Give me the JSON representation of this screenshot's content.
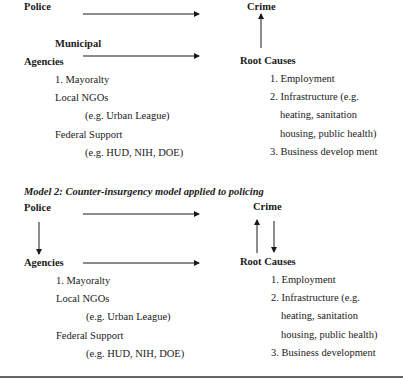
{
  "model1": {
    "police": "Police",
    "crime": "Crime",
    "municipal": "Municipal",
    "agencies": "Agencies",
    "root_causes": "Root Causes",
    "agency_items": [
      "1. Mayoralty",
      "Local NGOs",
      "(e.g. Urban League)",
      "Federal Support",
      "(e.g. HUD, NIH, DOE)"
    ],
    "root_items": [
      "1. Employment",
      "2. Infrastructure (e.g.",
      "heating, sanitation",
      "housing, public health)",
      "3. Business develop ment"
    ]
  },
  "model2": {
    "title": "Model 2: Counter-insurgency model applied to policing",
    "police": "Police",
    "crime": "Crime",
    "agencies": "Agencies",
    "root_causes": "Root Causes",
    "agency_items": [
      "1. Mayoralty",
      "Local NGOs",
      "(e.g. Urban League)",
      "Federal Support",
      "(e.g. HUD, NIH, DOE)"
    ],
    "root_items": [
      "1. Employment",
      "2. Infrastructure (e.g.",
      "heating, sanitation",
      "housing, public health)",
      "3. Business development"
    ]
  }
}
